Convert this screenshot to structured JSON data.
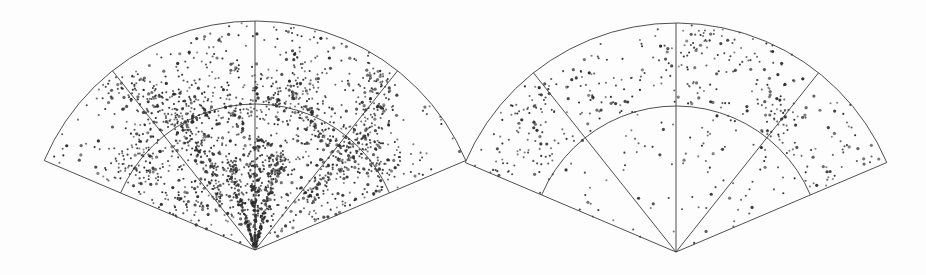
{
  "figure": {
    "title": "Galaxy redshift survey wedge diagrams",
    "background_color": "#fdfdfd",
    "line_color": "#3b3b3b",
    "point_color": "#2b2b2b",
    "width": 926,
    "height": 275
  },
  "panels": [
    {
      "id": "panel-left",
      "name": "observed-survey-wedge",
      "caption": "",
      "point_count": 2100,
      "apex": {
        "x": 255,
        "y": 250
      },
      "outer_radius": 229,
      "inner_radius": 146,
      "half_angle_deg": 67,
      "radial_line_angles_deg": [
        -38.5,
        0,
        38.5
      ],
      "arc_radii": [
        146,
        229
      ],
      "clustered": true
    },
    {
      "id": "panel-right",
      "name": "comparison-sample-wedge",
      "caption": "",
      "point_count": 520,
      "apex": {
        "x": 676,
        "y": 252
      },
      "outer_radius": 229,
      "inner_radius": 146,
      "half_angle_deg": 67,
      "radial_line_angles_deg": [
        -38.5,
        0,
        38.5
      ],
      "arc_radii": [
        146,
        229
      ],
      "clustered": false
    }
  ],
  "chart_data": {
    "type": "scatter",
    "title": "Galaxy redshift survey wedge diagrams",
    "subtitle": "",
    "xlabel": "",
    "ylabel": "",
    "legend": [],
    "grid": true,
    "projection": "polar-wedge",
    "axis_ranges": {
      "angle_deg": [
        -67,
        67
      ],
      "radius_px": [
        0,
        229
      ]
    },
    "grid_lines": {
      "arcs_radius_px": [
        146,
        229
      ],
      "radials_angle_deg": [
        -67,
        -38.5,
        0,
        38.5,
        67
      ]
    },
    "series": [
      {
        "name": "observed-survey-wedge",
        "panel": "panel-left",
        "marker": "dot",
        "color": "#2b2b2b",
        "n_points": 2100,
        "description": "Dense filamentary galaxy distribution with radial finger-of-god features converging on the apex and a prominent great-wall-like sheet near the inner arc",
        "density_profile": "clustered",
        "structures": [
          {
            "type": "finger-of-god",
            "angle_deg": 0,
            "radius_range_px": [
              0,
              110
            ]
          },
          {
            "type": "finger-of-god",
            "angle_deg": -16,
            "radius_range_px": [
              0,
              95
            ]
          },
          {
            "type": "finger-of-god",
            "angle_deg": 14,
            "radius_range_px": [
              0,
              100
            ]
          },
          {
            "type": "wall",
            "radius_px": 150,
            "angle_range_deg": [
              -60,
              60
            ]
          },
          {
            "type": "filament",
            "angle_deg": -34,
            "radius_range_px": [
              60,
              215
            ]
          },
          {
            "type": "filament",
            "angle_deg": 40,
            "radius_range_px": [
              70,
              220
            ]
          },
          {
            "type": "void",
            "angle_deg": -52,
            "radius_px": 200
          },
          {
            "type": "void",
            "angle_deg": 55,
            "radius_px": 195
          }
        ]
      },
      {
        "name": "comparison-sample-wedge",
        "panel": "panel-right",
        "marker": "dot",
        "color": "#2b2b2b",
        "n_points": 520,
        "description": "Sparser, largely uniform galaxy distribution concentrated beyond the inner arc with mild clumping and no finger-of-god spikes",
        "density_profile": "near-uniform",
        "structures": [
          {
            "type": "clump",
            "angle_deg": -46,
            "radius_px": 205
          },
          {
            "type": "clump",
            "angle_deg": 10,
            "radius_px": 210
          },
          {
            "type": "clump",
            "angle_deg": 38,
            "radius_px": 175
          }
        ]
      }
    ]
  }
}
